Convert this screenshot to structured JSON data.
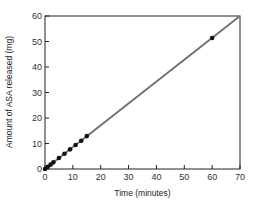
{
  "chart_data": {
    "type": "scatter",
    "title": "",
    "xlabel": "Time (minutes)",
    "ylabel": "Amount of ASA released (mg)",
    "xlim": [
      0,
      70
    ],
    "ylim": [
      0,
      60
    ],
    "xticks": [
      0,
      10,
      20,
      30,
      40,
      50,
      60,
      70
    ],
    "yticks": [
      0,
      10,
      20,
      30,
      40,
      50,
      60
    ],
    "grid": false,
    "legend": null,
    "series": [
      {
        "name": "Measured",
        "type": "scatter",
        "x": [
          0,
          1,
          2,
          3,
          5,
          7,
          9,
          11,
          13,
          15,
          60
        ],
        "y": [
          0,
          0.9,
          1.7,
          2.6,
          4.3,
          6.0,
          7.7,
          9.4,
          11.1,
          12.9,
          51.4
        ]
      },
      {
        "name": "Linear fit",
        "type": "line",
        "x": [
          0,
          70
        ],
        "y": [
          0,
          60
        ]
      }
    ],
    "colors": {
      "line": "#6e6e6e",
      "points": "#111111",
      "axes": "#222222"
    }
  }
}
